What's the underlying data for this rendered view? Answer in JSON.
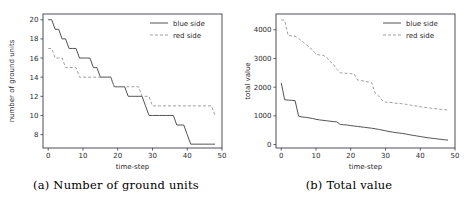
{
  "figure": {
    "panels": [
      {
        "id": "a",
        "caption": "(a)  Number of ground units"
      },
      {
        "id": "b",
        "caption": "(b)  Total value"
      }
    ]
  },
  "legend": {
    "blue_label": "blue side",
    "red_label": "red side",
    "blue_color": "#4a4a4a",
    "red_color": "#9a9a9a"
  },
  "chart_data": [
    {
      "type": "line",
      "title": "(a)  Number of ground units",
      "xlabel": "time-step",
      "ylabel": "number of ground units",
      "xlim": [
        -1.5,
        50
      ],
      "ylim": [
        6.6,
        20.6
      ],
      "xticks": [
        0,
        10,
        20,
        30,
        40,
        50
      ],
      "yticks": [
        8,
        10,
        12,
        14,
        16,
        18,
        20
      ],
      "grid": false,
      "legend_position": "upper right",
      "series": [
        {
          "name": "blue side",
          "style": "solid",
          "color": "#4a4a4a",
          "x": [
            0,
            1,
            2,
            3,
            4,
            5,
            6,
            7,
            8,
            9,
            10,
            11,
            12,
            13,
            14,
            15,
            16,
            17,
            18,
            19,
            20,
            21,
            22,
            23,
            24,
            25,
            26,
            27,
            28,
            29,
            30,
            31,
            32,
            33,
            34,
            35,
            36,
            37,
            38,
            39,
            40,
            41,
            42,
            43,
            44,
            45,
            46,
            47,
            48
          ],
          "y": [
            20,
            20,
            19,
            19,
            18,
            18,
            17,
            17,
            17,
            16,
            16,
            16,
            16,
            15,
            15,
            14,
            14,
            14,
            14,
            13,
            13,
            13,
            13,
            12,
            12,
            12,
            12,
            12,
            11,
            10,
            10,
            10,
            10,
            10,
            10,
            10,
            10,
            9,
            9,
            9,
            8,
            7,
            7,
            7,
            7,
            7,
            7,
            7,
            7
          ]
        },
        {
          "name": "red side",
          "style": "dashed",
          "color": "#9a9a9a",
          "x": [
            0,
            1,
            2,
            3,
            4,
            5,
            6,
            7,
            8,
            9,
            10,
            11,
            12,
            13,
            14,
            15,
            16,
            17,
            18,
            19,
            20,
            21,
            22,
            23,
            24,
            25,
            26,
            27,
            28,
            29,
            30,
            31,
            32,
            33,
            34,
            35,
            36,
            37,
            38,
            39,
            40,
            41,
            42,
            43,
            44,
            45,
            46,
            47,
            48
          ],
          "y": [
            17,
            17,
            16,
            16,
            16,
            15,
            15,
            15,
            15,
            14,
            14,
            14,
            14,
            14,
            14,
            14,
            14,
            14,
            14,
            13,
            13,
            13,
            13,
            13,
            13,
            13,
            13,
            12,
            12,
            12,
            11,
            11,
            11,
            11,
            11,
            11,
            11,
            11,
            11,
            11,
            11,
            11,
            11,
            11,
            11,
            11,
            11,
            11,
            10
          ]
        }
      ]
    },
    {
      "type": "line",
      "title": "(b)  Total value",
      "xlabel": "time-step",
      "ylabel": "total value",
      "xlim": [
        -1.5,
        50
      ],
      "ylim": [
        -120,
        4550
      ],
      "xticks": [
        0,
        10,
        20,
        30,
        40,
        50
      ],
      "yticks": [
        0,
        1000,
        2000,
        3000,
        4000
      ],
      "grid": false,
      "legend_position": "upper right",
      "series": [
        {
          "name": "blue side",
          "style": "solid",
          "color": "#4a4a4a",
          "x": [
            0,
            1,
            2,
            3,
            4,
            5,
            6,
            7,
            8,
            9,
            10,
            11,
            12,
            13,
            14,
            15,
            16,
            17,
            18,
            19,
            20,
            21,
            22,
            23,
            24,
            25,
            26,
            27,
            28,
            29,
            30,
            31,
            32,
            33,
            34,
            35,
            36,
            37,
            38,
            39,
            40,
            41,
            42,
            43,
            44,
            45,
            46,
            47,
            48
          ],
          "y": [
            2150,
            1560,
            1550,
            1540,
            1530,
            990,
            960,
            950,
            930,
            910,
            880,
            860,
            845,
            830,
            815,
            800,
            790,
            700,
            690,
            680,
            660,
            645,
            630,
            615,
            600,
            585,
            570,
            550,
            530,
            505,
            480,
            455,
            435,
            415,
            400,
            385,
            365,
            340,
            320,
            300,
            280,
            260,
            240,
            225,
            210,
            195,
            180,
            165,
            155
          ]
        },
        {
          "name": "red side",
          "style": "dashed",
          "color": "#9a9a9a",
          "x": [
            0,
            1,
            2,
            3,
            4,
            5,
            6,
            7,
            8,
            9,
            10,
            11,
            12,
            13,
            14,
            15,
            16,
            17,
            18,
            19,
            20,
            21,
            22,
            23,
            24,
            25,
            26,
            27,
            28,
            29,
            30,
            31,
            32,
            33,
            34,
            35,
            36,
            37,
            38,
            39,
            40,
            41,
            42,
            43,
            44,
            45,
            46,
            47,
            48
          ],
          "y": [
            4350,
            4330,
            3800,
            3790,
            3770,
            3700,
            3600,
            3500,
            3400,
            3300,
            3150,
            3120,
            3110,
            3050,
            2900,
            2800,
            2620,
            2500,
            2490,
            2480,
            2470,
            2460,
            2250,
            2230,
            2210,
            2180,
            2160,
            1800,
            1700,
            1550,
            1480,
            1470,
            1460,
            1440,
            1430,
            1420,
            1400,
            1380,
            1360,
            1340,
            1320,
            1300,
            1285,
            1270,
            1255,
            1240,
            1225,
            1215,
            1200
          ]
        }
      ]
    }
  ]
}
